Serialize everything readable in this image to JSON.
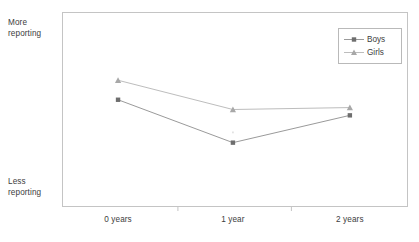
{
  "chart_data": {
    "type": "line",
    "title": "",
    "subtitle": "",
    "xlabel": "",
    "ylabel": "",
    "grid": false,
    "legend_position": "top-right",
    "categories": [
      "0 years",
      "1 year",
      "2 years"
    ],
    "y_axis": {
      "tick_labels": [],
      "high_label": "More\nreporting",
      "low_label": "Less\nreporting",
      "ylim": [
        0,
        100
      ]
    },
    "series": [
      {
        "name": "Boys",
        "marker": "square",
        "color": "#6e6e6e",
        "line_color": "#9a9a9a",
        "values": [
          55,
          33,
          47
        ]
      },
      {
        "name": "Girls",
        "marker": "triangle",
        "color": "#a8a8a8",
        "line_color": "#bdbdbd",
        "values": [
          65,
          50,
          51
        ]
      }
    ]
  },
  "axis_labels": {
    "high": "More\nreporting",
    "low": "Less\nreporting"
  },
  "xticks": [
    {
      "label": "0 years"
    },
    {
      "label": "1 year"
    },
    {
      "label": "2 years"
    }
  ],
  "legend": {
    "entries": [
      {
        "label": "Boys"
      },
      {
        "label": "Girls"
      }
    ]
  },
  "colors": {
    "frame": "#c4c4c4",
    "text": "#3d3d3d",
    "boys_marker": "#6e6e6e",
    "boys_line": "#9a9a9a",
    "girls_marker": "#a8a8a8",
    "girls_line": "#bdbdbd",
    "background": "#ffffff"
  }
}
